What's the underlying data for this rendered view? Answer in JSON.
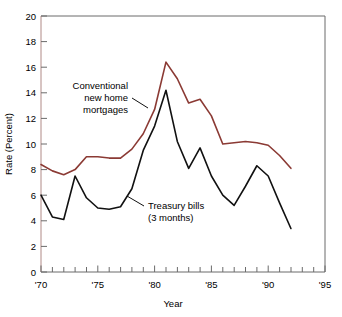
{
  "chart_data": {
    "type": "line",
    "title": "",
    "xlabel": "Year",
    "ylabel": "Rate (Percent)",
    "xlim": [
      1970,
      1995
    ],
    "ylim": [
      0,
      20
    ],
    "grid": false,
    "legend_position": "inline-annotations",
    "x_major_ticks": [
      1970,
      1975,
      1980,
      1985,
      1990,
      1995
    ],
    "x_major_tick_labels": [
      "'70",
      "'75",
      "'80",
      "'85",
      "'90",
      "'95"
    ],
    "x_minor_tick_step": 1,
    "y_ticks": [
      0,
      2,
      4,
      6,
      8,
      10,
      12,
      14,
      16,
      18,
      20
    ],
    "y_tick_labels": [
      "0",
      "2",
      "4",
      "6",
      "8",
      "10",
      "12",
      "14",
      "16",
      "18",
      "20"
    ],
    "x": [
      1970,
      1971,
      1972,
      1973,
      1974,
      1975,
      1976,
      1977,
      1978,
      1979,
      1980,
      1981,
      1982,
      1983,
      1984,
      1985,
      1986,
      1987,
      1988,
      1989,
      1990,
      1991,
      1992
    ],
    "series": [
      {
        "name": "Conventional new home mortgages",
        "color": "#8b3a34",
        "values": [
          8.4,
          7.9,
          7.6,
          8.0,
          9.0,
          9.0,
          8.9,
          8.9,
          9.6,
          10.8,
          12.7,
          16.4,
          15.1,
          13.2,
          13.5,
          12.2,
          10.0,
          10.1,
          10.2,
          10.1,
          9.9,
          9.1,
          8.1
        ]
      },
      {
        "name": "Treasury bills (3 months)",
        "color": "#111111",
        "values": [
          6.0,
          4.3,
          4.1,
          7.5,
          5.8,
          5.0,
          4.9,
          5.1,
          6.5,
          9.5,
          11.4,
          14.2,
          10.2,
          8.1,
          9.7,
          7.5,
          6.0,
          5.2,
          6.7,
          8.3,
          7.5,
          5.4,
          3.4
        ]
      }
    ],
    "annotations": [
      {
        "id": "mortgages-annotation",
        "lines": [
          "Conventional",
          "new home",
          "mortgages"
        ],
        "align": "right",
        "leader": true
      },
      {
        "id": "tbills-annotation",
        "lines": [
          "Treasury bills",
          "(3 months)"
        ],
        "align": "left",
        "leader": true
      }
    ]
  },
  "axes": {
    "y_title": "Rate (Percent)",
    "x_title": "Year",
    "y_labels": [
      "20",
      "18",
      "16",
      "14",
      "12",
      "10",
      "8",
      "6",
      "4",
      "2",
      "0"
    ],
    "x_labels": [
      "'70",
      "'75",
      "'80",
      "'85",
      "'90",
      "'95"
    ]
  },
  "annotations": {
    "mortgages": {
      "line1": "Conventional",
      "line2": "new home",
      "line3": "mortgages"
    },
    "tbills": {
      "line1": "Treasury bills",
      "line2": "(3 months)"
    }
  },
  "colors": {
    "mortgage_line": "#8b3a34",
    "tbill_line": "#111111",
    "axis": "#4a4a4a",
    "background": "#ffffff"
  }
}
